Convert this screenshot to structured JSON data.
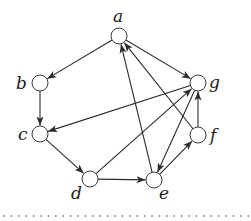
{
  "diagram": {
    "type": "directed-graph",
    "node_radius": 8,
    "colors": {
      "stroke": "#2b2b2b",
      "fill": "#ffffff",
      "label": "#1a1a1a",
      "separator": "#555555"
    },
    "nodes": [
      {
        "id": "a",
        "label": "a",
        "x": 119,
        "y": 36,
        "label_dx": -6,
        "label_dy": -14
      },
      {
        "id": "b",
        "label": "b",
        "x": 40,
        "y": 83,
        "label_dx": -24,
        "label_dy": 6
      },
      {
        "id": "c",
        "label": "c",
        "x": 40,
        "y": 134,
        "label_dx": -22,
        "label_dy": 6
      },
      {
        "id": "d",
        "label": "d",
        "x": 90,
        "y": 179,
        "label_dx": -19,
        "label_dy": 20
      },
      {
        "id": "e",
        "label": "e",
        "x": 154,
        "y": 180,
        "label_dx": 5,
        "label_dy": 19
      },
      {
        "id": "f",
        "label": "f",
        "x": 198,
        "y": 135,
        "label_dx": 12,
        "label_dy": 6
      },
      {
        "id": "g",
        "label": "g",
        "x": 198,
        "y": 83,
        "label_dx": 11,
        "label_dy": 5
      }
    ],
    "edges": [
      {
        "from": "a",
        "to": "b"
      },
      {
        "from": "a",
        "to": "g"
      },
      {
        "from": "b",
        "to": "c"
      },
      {
        "from": "c",
        "to": "d"
      },
      {
        "from": "d",
        "to": "e"
      },
      {
        "from": "d",
        "to": "g"
      },
      {
        "from": "e",
        "to": "a"
      },
      {
        "from": "e",
        "to": "f"
      },
      {
        "from": "f",
        "to": "a"
      },
      {
        "from": "f",
        "to": "g"
      },
      {
        "from": "g",
        "to": "c"
      },
      {
        "from": "g",
        "to": "e"
      }
    ],
    "separator": {
      "style": "dotted",
      "y": 216,
      "x1": 4,
      "x2": 250
    }
  }
}
